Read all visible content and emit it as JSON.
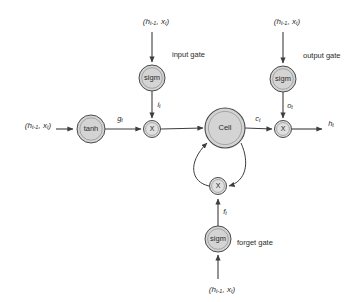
{
  "diagram": {
    "background_color": "#ffffff",
    "node_fill_color": "#d4d4d4",
    "edge_color": "#3d3d3d"
  },
  "nodes": {
    "tanh": {
      "label": "tanh",
      "cx": 91,
      "cy": 129,
      "r": 14
    },
    "cell": {
      "label": "Cell",
      "cx": 225,
      "cy": 128,
      "r": 20
    },
    "input_gate_sigm": {
      "label": "sigm",
      "cx": 152,
      "cy": 78,
      "r": 13
    },
    "output_gate_sigm": {
      "label": "sigm",
      "cx": 283,
      "cy": 79,
      "r": 13
    },
    "forget_gate_sigm": {
      "label": "sigm",
      "cx": 218,
      "cy": 239,
      "r": 13
    },
    "mul_input": {
      "label": "X",
      "cx": 152,
      "cy": 129,
      "r": 8.5
    },
    "mul_output": {
      "label": "X",
      "cx": 283,
      "cy": 129,
      "r": 8.5
    },
    "mul_forget": {
      "label": "X",
      "cx": 218,
      "cy": 186,
      "r": 8.5
    }
  },
  "gate_labels": {
    "input_gate": "input gate",
    "output_gate": "output gate",
    "forget_gate": "forget gate"
  },
  "signals": {
    "g_t": {
      "base": "g",
      "sub": "t"
    },
    "i_t": {
      "base": "i",
      "sub": "t"
    },
    "o_t": {
      "base": "o",
      "sub": "t"
    },
    "f_t": {
      "base": "f",
      "sub": "t"
    },
    "c_t": {
      "base": "c",
      "sub": "t"
    },
    "h_t": {
      "base": "h",
      "sub": "t"
    }
  },
  "inputs": {
    "left": {
      "open": "(",
      "h": "h",
      "h_sub": "t-1",
      "comma": ", ",
      "x": "x",
      "x_sub": "t",
      "close": ")"
    },
    "input_gate": {
      "open": "(",
      "h": "h",
      "h_sub": "t-1",
      "comma": ", ",
      "x": "x",
      "x_sub": "t",
      "close": ")"
    },
    "output_gate": {
      "open": "(",
      "h": "h",
      "h_sub": "t-1",
      "comma": ", ",
      "x": "x",
      "x_sub": "t",
      "close": ")"
    },
    "forget_gate": {
      "open": "(",
      "h": "h",
      "h_sub": "t-1",
      "comma": ", ",
      "x": "x",
      "x_sub": "t",
      "close": ")"
    }
  }
}
